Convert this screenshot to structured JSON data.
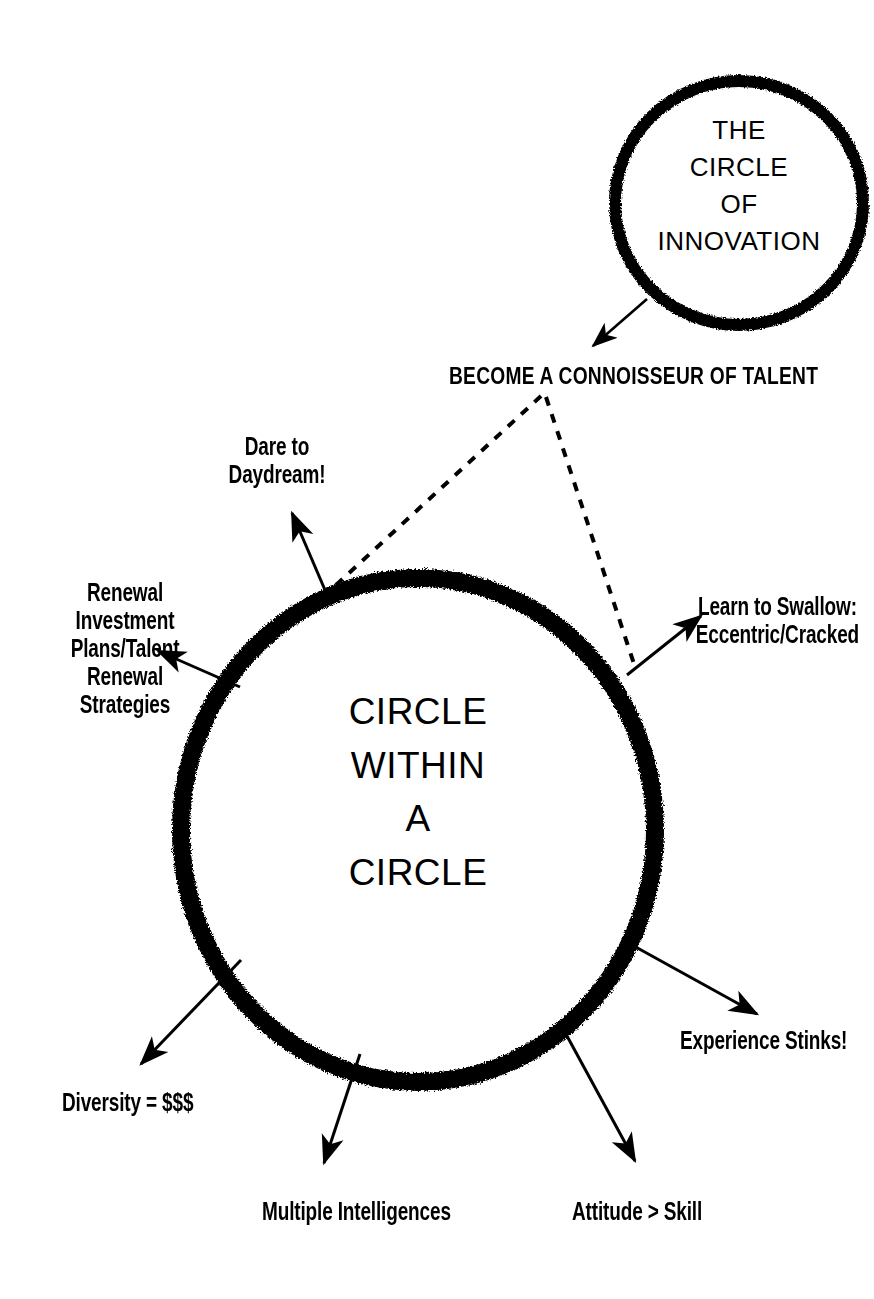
{
  "page": {
    "background_color": "#ffffff",
    "ink_color": "#000000",
    "width": 874,
    "height": 1299
  },
  "small_circle": {
    "name": "circle-of-innovation",
    "lines": [
      "THE",
      "CIRCLE",
      "OF",
      "INNOVATION"
    ],
    "text": "THE\nCIRCLE\nOF\nINNOVATION",
    "cx": 739,
    "cy": 203,
    "rx": 127,
    "ry": 125,
    "stroke_width": 11
  },
  "big_circle": {
    "name": "circle-within-a-circle",
    "lines": [
      "CIRCLE",
      "WITHIN",
      "A",
      "CIRCLE"
    ],
    "text": "CIRCLE\nWITHIN\nA\nCIRCLE",
    "cx": 418,
    "cy": 830,
    "rx": 240,
    "ry": 255,
    "stroke_width": 17
  },
  "headline": {
    "name": "become-a-connoisseur-of-talent",
    "text": "BECOME A CONNOISSEUR OF TALENT"
  },
  "spokes": [
    {
      "id": "dare-to-daydream",
      "text": "Dare to\nDaydream!",
      "align": "center",
      "x": 212,
      "y": 432,
      "width": 130
    },
    {
      "id": "renewal-investment-plans",
      "text": "Renewal\nInvestment\nPlans/Talent\nRenewal\nStrategies",
      "align": "center",
      "x": 50,
      "y": 578,
      "width": 150
    },
    {
      "id": "learn-to-swallow",
      "text": "Learn to Swallow:\nEccentric/Cracked",
      "align": "center",
      "x": 690,
      "y": 592,
      "width": 230
    },
    {
      "id": "experience-stinks",
      "text": "Experience Stinks!",
      "align": "left",
      "x": 680,
      "y": 1026,
      "width": 230
    },
    {
      "id": "diversity-equals-money",
      "text": "Diversity = $$$",
      "align": "left",
      "x": 62,
      "y": 1088,
      "width": 210
    },
    {
      "id": "multiple-intelligences",
      "text": "Multiple Intelligences",
      "align": "left",
      "x": 262,
      "y": 1197,
      "width": 260
    },
    {
      "id": "attitude-greater-than-skill",
      "text": "Attitude > Skill",
      "align": "left",
      "x": 572,
      "y": 1197,
      "width": 200
    }
  ],
  "connectors": {
    "innovation_arrow": {
      "name": "arrow-innovation-to-talent",
      "from": [
        645,
        300
      ],
      "to": [
        591,
        347
      ],
      "style": "solid"
    },
    "dashed_left": {
      "name": "dashed-talent-to-circle-left",
      "from": [
        540,
        396
      ],
      "to": [
        322,
        596
      ],
      "style": "dashed"
    },
    "dashed_right": {
      "name": "dashed-talent-to-circle-right",
      "from": [
        545,
        397
      ],
      "to": [
        634,
        666
      ],
      "style": "dashed"
    },
    "arrows": [
      {
        "name": "arrow-dare-to-daydream",
        "from": [
          330,
          602
        ],
        "to": [
          291,
          512
        ]
      },
      {
        "name": "arrow-renewal-investment",
        "from": [
          238,
          685
        ],
        "to": [
          157,
          650
        ]
      },
      {
        "name": "arrow-learn-to-swallow",
        "from": [
          628,
          673
        ],
        "to": [
          700,
          615
        ]
      },
      {
        "name": "arrow-experience-stinks",
        "from": [
          625,
          942
        ],
        "to": [
          756,
          1013
        ]
      },
      {
        "name": "arrow-diversity",
        "from": [
          240,
          962
        ],
        "to": [
          140,
          1063
        ]
      },
      {
        "name": "arrow-multiple-intelligences",
        "from": [
          360,
          1055
        ],
        "to": [
          323,
          1162
        ]
      },
      {
        "name": "arrow-attitude-skill",
        "from": [
          568,
          1038
        ],
        "to": [
          634,
          1160
        ]
      }
    ]
  }
}
